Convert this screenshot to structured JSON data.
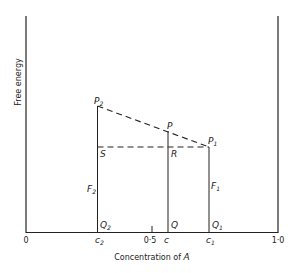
{
  "diagram": {
    "y_axis_label": "Free energy",
    "x_axis_label": "Concentration of ",
    "x_axis_var": "A",
    "x_ticks": {
      "zero": "0",
      "half": "0·5",
      "one": "1·0"
    },
    "x_markers": {
      "c2": "c",
      "c2_sub": "2",
      "c": "c",
      "c1": "c",
      "c1_sub": "1"
    },
    "points": {
      "P2": {
        "main": "P",
        "sub": "2"
      },
      "P": {
        "main": "P"
      },
      "P1": {
        "main": "P",
        "sub": "1"
      },
      "S": {
        "main": "S"
      },
      "R": {
        "main": "R"
      },
      "F2": {
        "main": "F",
        "sub": "2"
      },
      "F1": {
        "main": "F",
        "sub": "1"
      },
      "Q2": {
        "main": "Q",
        "sub": "2"
      },
      "Q": {
        "main": "Q"
      },
      "Q1": {
        "main": "Q",
        "sub": "1"
      }
    },
    "line_color": "#222222"
  }
}
